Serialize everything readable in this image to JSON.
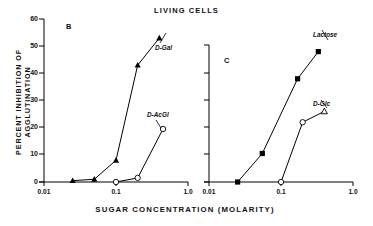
{
  "figure": {
    "title": "LIVING CELLS",
    "y_axis_title": "PERCENT  INHIBITION  OF  AGGLUTINATION",
    "x_axis_title": "SUGAR  CONCENTRATION  (MOLARITY)"
  },
  "panels": {
    "b": {
      "letter": "B"
    },
    "c": {
      "letter": "C"
    }
  },
  "axes": {
    "y_ticks": [
      "0",
      "10",
      "20",
      "30",
      "40",
      "50",
      "60"
    ],
    "x_ticks_left": [
      "0.01",
      "0.1",
      "1.0"
    ],
    "x_ticks_right": [
      "0.01",
      "0.1",
      "1.0"
    ]
  },
  "series_labels": {
    "d_gal": "D-Gal",
    "d_acgl": "D-AcGl",
    "lactose": "Lactose",
    "d_glc": "D-Glc"
  },
  "chart_data": [
    {
      "type": "line",
      "panel": "B",
      "title": "LIVING CELLS",
      "xlabel": "SUGAR CONCENTRATION (MOLARITY)",
      "ylabel": "PERCENT INHIBITION OF AGGLUTINATION",
      "xscale": "log",
      "xlim": [
        0.01,
        1.0
      ],
      "ylim": [
        0,
        60
      ],
      "yticks": [
        0,
        10,
        20,
        30,
        40,
        50,
        60
      ],
      "xticks": [
        0.01,
        0.1,
        1.0
      ],
      "grid": false,
      "legend": "inline-annotations",
      "series": [
        {
          "name": "D-Gal",
          "marker": "filled-triangle",
          "x": [
            0.025,
            0.05,
            0.1,
            0.2,
            0.4
          ],
          "y": [
            0.5,
            1.0,
            8.0,
            43.0,
            53.0
          ]
        },
        {
          "name": "D-AcGl",
          "marker": "open-circle",
          "x": [
            0.1,
            0.2,
            0.45
          ],
          "y": [
            0.0,
            1.5,
            19.5
          ]
        }
      ]
    },
    {
      "type": "line",
      "panel": "C",
      "title": "LIVING CELLS",
      "xlabel": "SUGAR CONCENTRATION (MOLARITY)",
      "ylabel": "PERCENT INHIBITION OF AGGLUTINATION",
      "xscale": "log",
      "xlim": [
        0.01,
        1.0
      ],
      "ylim": [
        0,
        60
      ],
      "yticks": [
        0,
        10,
        20,
        30,
        40,
        50,
        60
      ],
      "xticks": [
        0.01,
        0.1,
        1.0
      ],
      "grid": false,
      "legend": "inline-annotations",
      "series": [
        {
          "name": "Lactose",
          "marker": "filled-square",
          "x": [
            0.025,
            0.055,
            0.17,
            0.33
          ],
          "y": [
            0.0,
            10.5,
            38.0,
            48.0
          ]
        },
        {
          "name": "D-Glc",
          "marker": "open-circle-triangle",
          "x": [
            0.1,
            0.2,
            0.4
          ],
          "y": [
            0.0,
            22.0,
            26.0
          ]
        }
      ]
    }
  ],
  "colors": {
    "ink": "#000000",
    "background": "#ffffff"
  }
}
